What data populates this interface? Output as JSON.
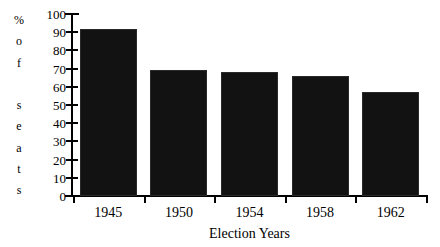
{
  "chart_data": {
    "type": "bar",
    "title": "",
    "subtitle": "",
    "categories": [
      "1945",
      "1950",
      "1954",
      "1958",
      "1962"
    ],
    "values": [
      92,
      69,
      68,
      66,
      57
    ],
    "xlabel": "Election Years",
    "ylabel": "% of seats",
    "ylabel_chars": [
      "%",
      "o",
      "f",
      " ",
      "s",
      "e",
      "a",
      "t",
      "s"
    ],
    "ylim": [
      0,
      100
    ],
    "ytick_values": [
      0,
      10,
      20,
      30,
      40,
      50,
      60,
      70,
      80,
      90,
      100
    ],
    "ytick_labels": [
      "0",
      "10",
      "20",
      "30",
      "40",
      "50",
      "60",
      "70",
      "80",
      "90",
      "100"
    ],
    "grid": false,
    "legend": null,
    "legend_position": "none",
    "annotations": [],
    "bar_color": "#121212",
    "axis_color": "#000000",
    "background_color": "#ffffff"
  }
}
